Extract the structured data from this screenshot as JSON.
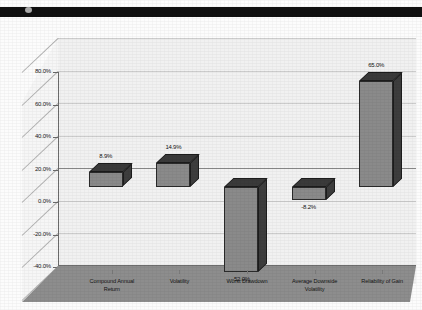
{
  "header": {
    "band_color": "#111111",
    "speck_name": "page-marker-dot"
  },
  "chart_data": {
    "type": "bar",
    "title": "",
    "subtitle": "",
    "xlabel": "",
    "ylabel": "",
    "categories": [
      "Compound Annual Return",
      "Volatility",
      "Worst Drawdown",
      "Average Downside Volatility",
      "Reliability of Gain"
    ],
    "category_lines": [
      [
        "Compound Annual",
        "Return"
      ],
      [
        "Volatility"
      ],
      [
        "Worst Drawdown"
      ],
      [
        "Average Downside",
        "Volatility"
      ],
      [
        "Reliability of Gain"
      ]
    ],
    "values": [
      8.9,
      14.9,
      -52.0,
      -8.2,
      65.0
    ],
    "data_labels": [
      "8.9%",
      "14.9%",
      "-52.0%",
      "-8.2%",
      "65.0%"
    ],
    "ylim": [
      -60,
      80
    ],
    "ytick_values": [
      80,
      60,
      40,
      20,
      0,
      -20,
      -40,
      -60
    ],
    "ytick_labels": [
      "80.0%",
      "60.0%",
      "40.0%",
      "20.0%",
      "0.0%",
      "-20.0%",
      "-40.0%",
      "-60.0%"
    ],
    "grid": true,
    "legend": "none",
    "three_d": true,
    "bar_color": "#8a8a8a",
    "bar_top_color": "#3a3a3a",
    "bar_side_color": "#3d3d3d",
    "floor_color": "#8d8d8d",
    "wall_color": "#f1f1f1",
    "gridline_color": "#b4b4b4",
    "zero_line_color": "#8a8a8a"
  }
}
